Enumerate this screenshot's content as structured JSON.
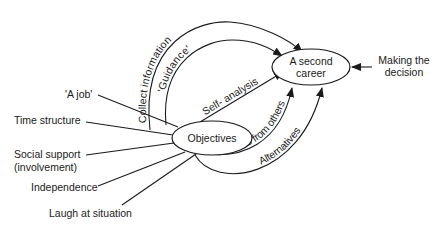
{
  "diagram": {
    "center_node": "Objectives",
    "goal_node": "A second career",
    "goal_lines": [
      "A second",
      "career"
    ],
    "decision_label_lines": [
      "Making the",
      "decision"
    ],
    "left_factors": [
      {
        "label": "'A job'"
      },
      {
        "label": "Time structure"
      },
      {
        "label": "Social support",
        "label2": "(involvement)"
      },
      {
        "label": "Independence"
      },
      {
        "label": "Laugh at situation"
      }
    ],
    "paths": [
      {
        "label": "Collect information"
      },
      {
        "label": "'Guidance'"
      },
      {
        "label": "Self- analysis"
      },
      {
        "label": "Ideas from others"
      },
      {
        "label": "Alternatives"
      }
    ]
  }
}
